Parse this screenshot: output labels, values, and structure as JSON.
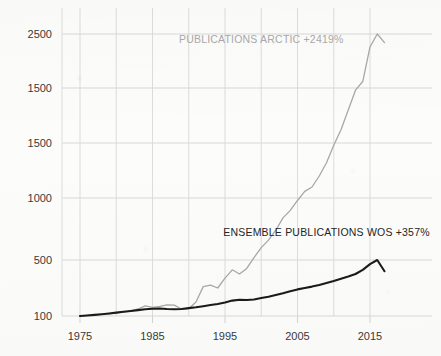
{
  "chart_data": {
    "type": "line",
    "title": "",
    "subtitle": "",
    "xlabel": "",
    "ylabel": "",
    "grid": true,
    "legend_position": "inline-annotation",
    "xlim": [
      1973,
      2018
    ],
    "ylim": [
      100,
      2500
    ],
    "y_scale": "linear-as-printed",
    "x_ticks": [
      "1975",
      "1985",
      "1995",
      "2005",
      "2015"
    ],
    "x_tick_values": [
      1975,
      1985,
      1995,
      2005,
      2015
    ],
    "y_ticks": [
      "2500",
      "1500",
      "1500",
      "1000",
      "500",
      "100"
    ],
    "y_tick_values": [
      2500,
      2000,
      1500,
      1000,
      500,
      100
    ],
    "y_tick_note": "Second tick from top is printed as 1500 in the source image (duplicate of the 1500 below it); its true gridline position corresponds to 2000.",
    "annotations": [
      {
        "name": "arctic-label",
        "text": "PUBLICATIONS ARCTIC +2419%",
        "color": "#a9a9a9",
        "x": 2000,
        "y": 2420
      },
      {
        "name": "wos-label",
        "text": "ENSEMBLE PUBLICATIONS WOS +357%",
        "color": "#252525",
        "x": 2009,
        "y": 690
      }
    ],
    "series": [
      {
        "name": "PUBLICATIONS ARCTIC +2419%",
        "label": "PUBLICATIONS ARCTIC +2419%",
        "color": "#a8a8a8",
        "growth_percent": 2419,
        "x": [
          1975,
          1976,
          1977,
          1978,
          1979,
          1980,
          1981,
          1982,
          1983,
          1984,
          1985,
          1986,
          1987,
          1988,
          1989,
          1990,
          1991,
          1992,
          1993,
          1994,
          1995,
          1996,
          1997,
          1998,
          1999,
          2000,
          2001,
          2002,
          2003,
          2004,
          2005,
          2006,
          2007,
          2008,
          2009,
          2010,
          2011,
          2012,
          2013,
          2014,
          2015,
          2016,
          2017
        ],
        "values": [
          100,
          104,
          108,
          112,
          116,
          122,
          128,
          136,
          150,
          172,
          162,
          168,
          180,
          178,
          150,
          152,
          200,
          310,
          320,
          300,
          370,
          430,
          400,
          440,
          520,
          600,
          660,
          740,
          840,
          900,
          980,
          1060,
          1100,
          1200,
          1320,
          1480,
          1620,
          1800,
          1980,
          2060,
          2380,
          2500,
          2420
        ]
      },
      {
        "name": "ENSEMBLE PUBLICATIONS WOS +357%",
        "label": "ENSEMBLE PUBLICATIONS WOS +357%",
        "color": "#1b1b1b",
        "growth_percent": 357,
        "x": [
          1975,
          1976,
          1977,
          1978,
          1979,
          1980,
          1981,
          1982,
          1983,
          1984,
          1985,
          1986,
          1987,
          1988,
          1989,
          1990,
          1991,
          1992,
          1993,
          1994,
          1995,
          1996,
          1997,
          1998,
          1999,
          2000,
          2001,
          2002,
          2003,
          2004,
          2005,
          2006,
          2007,
          2008,
          2009,
          2010,
          2011,
          2012,
          2013,
          2014,
          2015,
          2016,
          2017
        ],
        "values": [
          100,
          104,
          108,
          113,
          118,
          124,
          130,
          136,
          142,
          148,
          152,
          154,
          150,
          148,
          150,
          156,
          162,
          170,
          178,
          186,
          196,
          210,
          216,
          214,
          218,
          228,
          238,
          250,
          262,
          276,
          290,
          300,
          310,
          322,
          336,
          350,
          366,
          382,
          400,
          430,
          470,
          500,
          420
        ]
      }
    ]
  }
}
